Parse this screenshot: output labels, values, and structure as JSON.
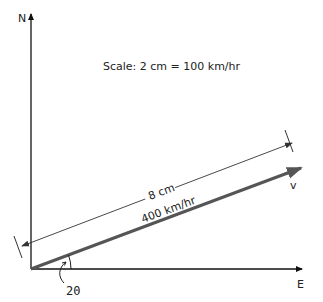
{
  "diagram": {
    "axes": {
      "north_label": "N",
      "east_label": "E"
    },
    "scale_text": "Scale: 2 cm = 100 km/hr",
    "vector": {
      "label": "v",
      "magnitude_text": "400 km/hr",
      "drawn_length_text": "8 cm",
      "angle_label": "20",
      "angle_degrees": 20
    },
    "colors": {
      "axis": "#111111",
      "vector": "#555555",
      "dimension": "#333333",
      "text": "#222222"
    }
  }
}
